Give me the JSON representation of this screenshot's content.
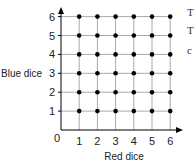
{
  "chart_data": {
    "type": "scatter",
    "title": "",
    "xlabel": "Red dice",
    "ylabel": "Blue dice",
    "x_ticks": [
      0,
      1,
      2,
      3,
      4,
      5,
      6
    ],
    "y_ticks": [
      1,
      2,
      3,
      4,
      5,
      6
    ],
    "origin_label": "0",
    "xlim": [
      0,
      6
    ],
    "ylim": [
      0,
      6
    ],
    "grid": true,
    "legend": null,
    "points": [
      [
        1,
        1
      ],
      [
        2,
        1
      ],
      [
        3,
        1
      ],
      [
        4,
        1
      ],
      [
        5,
        1
      ],
      [
        6,
        1
      ],
      [
        1,
        2
      ],
      [
        2,
        2
      ],
      [
        3,
        2
      ],
      [
        4,
        2
      ],
      [
        5,
        2
      ],
      [
        6,
        2
      ],
      [
        1,
        3
      ],
      [
        2,
        3
      ],
      [
        3,
        3
      ],
      [
        4,
        3
      ],
      [
        5,
        3
      ],
      [
        6,
        3
      ],
      [
        1,
        4
      ],
      [
        2,
        4
      ],
      [
        3,
        4
      ],
      [
        4,
        4
      ],
      [
        5,
        4
      ],
      [
        6,
        4
      ],
      [
        1,
        5
      ],
      [
        2,
        5
      ],
      [
        3,
        5
      ],
      [
        4,
        5
      ],
      [
        5,
        5
      ],
      [
        6,
        5
      ],
      [
        1,
        6
      ],
      [
        2,
        6
      ],
      [
        3,
        6
      ],
      [
        4,
        6
      ],
      [
        5,
        6
      ],
      [
        6,
        6
      ]
    ],
    "point_color": "#000000",
    "grid_color": "#aaaaaa",
    "axis_color": "#000000"
  },
  "labels": {
    "x_axis": "Red dice",
    "y_axis": "Blue dice",
    "origin": "0",
    "x_ticks": [
      "1",
      "2",
      "3",
      "4",
      "5",
      "6"
    ],
    "y_ticks": [
      "1",
      "2",
      "3",
      "4",
      "5",
      "6"
    ]
  },
  "edge_fragments": [
    "T",
    "T",
    "c"
  ]
}
